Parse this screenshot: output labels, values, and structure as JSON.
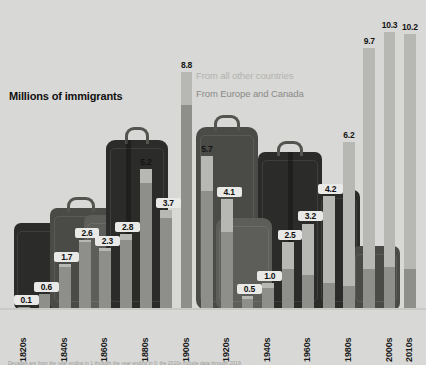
{
  "chart_data": {
    "type": "bar",
    "title": "Millions of immigrants",
    "xlabel": "",
    "ylabel": "Millions of immigrants",
    "ylim": [
      0,
      10.8
    ],
    "grid": false,
    "legend_position": "upper-center-right",
    "stacked": true,
    "categories": [
      "1820s",
      "1830s",
      "1840s",
      "1850s",
      "1860s",
      "1870s",
      "1880s",
      "1890s",
      "1900s",
      "1910s",
      "1920s",
      "1930s",
      "1940s",
      "1950s",
      "1960s",
      "1970s",
      "1980s",
      "1990s",
      "2000s",
      "2010s"
    ],
    "tick_labels": [
      "1820s",
      "",
      "1840s",
      "",
      "1860s",
      "",
      "1880s",
      "",
      "1900s",
      "",
      "1920s",
      "",
      "1940s",
      "",
      "1960s",
      "",
      "1980s",
      "",
      "2000s",
      "2010s"
    ],
    "values": [
      0.1,
      0.6,
      1.7,
      2.6,
      2.3,
      2.8,
      5.2,
      3.7,
      8.8,
      5.7,
      4.1,
      0.5,
      1.0,
      2.5,
      3.2,
      4.2,
      6.2,
      9.7,
      10.3,
      10.2
    ],
    "value_labels": [
      "0.1",
      "0.6",
      "1.7",
      "2.6",
      "2.3",
      "2.8",
      "5.2",
      "3.7",
      "8.8",
      "5.7",
      "4.1",
      "0.5",
      "1.0",
      "2.5",
      "3.2",
      "4.2",
      "6.2",
      "9.7",
      "10.3",
      "10.2"
    ],
    "series": [
      {
        "name": "From Europe and Canada",
        "color": "#8e8e8b",
        "values": [
          0.1,
          0.6,
          1.6,
          2.5,
          2.2,
          2.6,
          4.7,
          3.4,
          7.6,
          4.4,
          2.9,
          0.4,
          0.8,
          1.5,
          1.3,
          1.0,
          0.9,
          1.5,
          1.6,
          1.5
        ]
      },
      {
        "name": "From all other countries",
        "color": "#b7b7b4",
        "values": [
          0.0,
          0.0,
          0.1,
          0.1,
          0.1,
          0.2,
          0.5,
          0.3,
          1.2,
          1.3,
          1.2,
          0.1,
          0.2,
          1.0,
          1.9,
          3.2,
          5.3,
          8.2,
          8.7,
          8.7
        ]
      }
    ],
    "legend": [
      {
        "label": "From all other countries",
        "color": "#b3b3b0"
      },
      {
        "label": "From Europe and Canada",
        "color": "#8a8a87"
      }
    ]
  },
  "footnote": "Decades are from the year ending in 1 through the year ending in 0; the 2010s include data through 2019."
}
